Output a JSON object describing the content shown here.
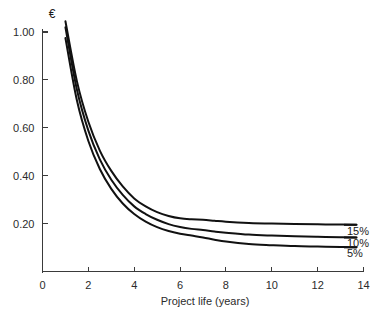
{
  "chart_data": {
    "type": "line",
    "title": "",
    "subtitle": "",
    "xlabel": "Project life (years)",
    "ylabel": "€",
    "ylabel_position": "above-axis-top",
    "xlim": [
      0,
      14
    ],
    "ylim": [
      0,
      1.05
    ],
    "grid": false,
    "legend_position": "right-end-of-line",
    "xticks": [
      0,
      2,
      4,
      6,
      8,
      10,
      12,
      14
    ],
    "xtick_labels": [
      "0",
      "2",
      "4",
      "6",
      "8",
      "10",
      "12",
      "14"
    ],
    "yticks": [
      0.2,
      0.4,
      0.6,
      0.8,
      1.0
    ],
    "ytick_labels": [
      "0.20",
      "0.40",
      "0.60",
      "0.80",
      "1.00"
    ],
    "x": [
      1,
      1.5,
      2,
      2.5,
      3,
      3.5,
      4,
      4.5,
      5,
      5.5,
      6,
      6.5,
      7,
      7.5,
      8,
      9,
      10,
      11,
      12,
      13,
      13.7
    ],
    "series": [
      {
        "name": "15%",
        "label": "15%",
        "color": "#111111",
        "values": [
          1.045,
          0.795,
          0.625,
          0.505,
          0.42,
          0.355,
          0.305,
          0.272,
          0.248,
          0.232,
          0.222,
          0.218,
          0.216,
          0.212,
          0.208,
          0.203,
          0.2,
          0.198,
          0.197,
          0.196,
          0.195
        ]
      },
      {
        "name": "10%",
        "label": "10%",
        "color": "#111111",
        "values": [
          1.02,
          0.76,
          0.588,
          0.468,
          0.383,
          0.32,
          0.272,
          0.24,
          0.216,
          0.198,
          0.186,
          0.178,
          0.173,
          0.167,
          0.162,
          0.154,
          0.15,
          0.147,
          0.145,
          0.143,
          0.142
        ]
      },
      {
        "name": "5%",
        "label": "5%",
        "color": "#111111",
        "values": [
          0.975,
          0.715,
          0.545,
          0.428,
          0.345,
          0.284,
          0.24,
          0.208,
          0.185,
          0.169,
          0.158,
          0.15,
          0.142,
          0.133,
          0.125,
          0.115,
          0.11,
          0.106,
          0.104,
          0.102,
          0.101
        ]
      }
    ]
  }
}
